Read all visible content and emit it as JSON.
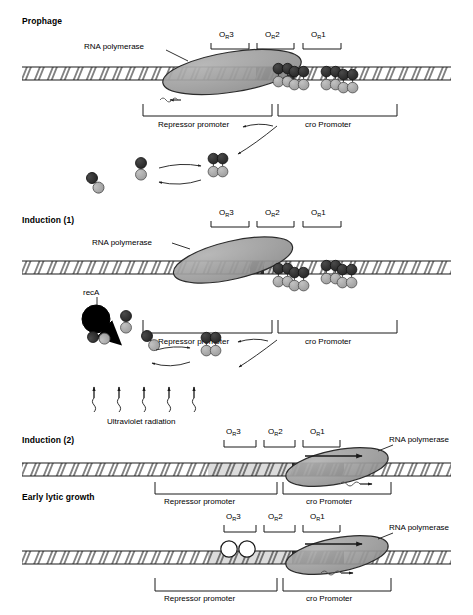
{
  "figure": {
    "kind": "lambda-phage-repressor-regulation-diagram",
    "operator_labels": {
      "or3": "O",
      "or3_sub": "R",
      "or3_num": "3",
      "or2": "O",
      "or2_sub": "R",
      "or2_num": "2",
      "or1": "O",
      "or1_sub": "R",
      "or1_num": "1"
    },
    "promoters": {
      "repressor": "Repressor promoter",
      "cro": "cro Promoter"
    },
    "polymerase_label": "RNA polymerase",
    "reca_label": "recA",
    "uv_label": "Ultraviolet radiation",
    "colors": {
      "dna_fill": "#ffffff",
      "dna_stroke": "#1a1a1a",
      "polymerase_fill": "#9b9b9b",
      "polymerase_stroke": "#2b2b2b",
      "dark_subunit": "#2e2e2e",
      "light_subunit": "#a8a8a8",
      "reca_fill": "#000000",
      "empty_subunit": "#ffffff",
      "text": "#1a1a1a"
    }
  },
  "panels": [
    {
      "id": "prophage",
      "title": "Prophage",
      "polymerase_label": "RNA polymerase",
      "operators": [
        "O_R3",
        "O_R2",
        "O_R1"
      ],
      "promoter_left": "Repressor promoter",
      "promoter_right": "cro Promoter",
      "bound_dimers": 4,
      "bound_at": [
        "O_R2",
        "O_R2",
        "O_R1",
        "O_R1"
      ],
      "free_monomers": 2,
      "free_dimers": 1,
      "transcript_direction": "leftward",
      "has_reca": false,
      "has_uv": false
    },
    {
      "id": "induction-1",
      "title": "Induction (1)",
      "polymerase_label": "RNA polymerase",
      "operators": [
        "O_R3",
        "O_R2",
        "O_R1"
      ],
      "promoter_left": "Repressor promoter",
      "promoter_right": "cro Promoter",
      "bound_dimers": 4,
      "bound_at": [
        "O_R2",
        "O_R2",
        "O_R1",
        "O_R1"
      ],
      "free_monomers": 3,
      "free_dimers": 1,
      "reca_label": "recA",
      "uv_label": "Ultraviolet radiation",
      "uv_rays": 5,
      "transcript_direction": "none",
      "has_reca": true,
      "has_uv": true
    },
    {
      "id": "induction-2",
      "title": "Induction (2)",
      "polymerase_label": "RNA polymerase",
      "operators": [
        "O_R3",
        "O_R2",
        "O_R1"
      ],
      "promoter_left": "Repressor promoter",
      "promoter_right": "cro Promoter",
      "bound_dimers": 0,
      "bound_at": [],
      "free_monomers": 0,
      "free_dimers": 0,
      "transcript_direction": "rightward",
      "has_reca": false,
      "has_uv": false
    },
    {
      "id": "early-lytic-growth",
      "title": "Early lytic growth",
      "polymerase_label": "RNA polymerase",
      "operators": [
        "O_R3",
        "O_R2",
        "O_R1"
      ],
      "promoter_left": "Repressor promoter",
      "promoter_right": "cro Promoter",
      "bound_dimers": 1,
      "bound_at": [
        "O_R3"
      ],
      "empty_subunits": 2,
      "free_monomers": 0,
      "free_dimers": 0,
      "transcript_direction": "rightward",
      "has_reca": false,
      "has_uv": false
    }
  ]
}
